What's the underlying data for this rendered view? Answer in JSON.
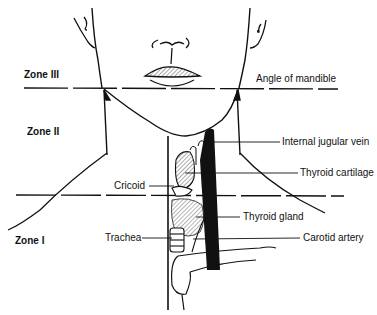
{
  "zones": [
    {
      "id": "zone-3",
      "label": "Zone III"
    },
    {
      "id": "zone-2",
      "label": "Zone II"
    },
    {
      "id": "zone-1",
      "label": "Zone I"
    }
  ],
  "labels": {
    "angle_of_mandible": "Angle of mandible",
    "internal_jugular_vein": "Internal jugular vein",
    "thyroid_cartilage": "Thyroid cartilage",
    "cricoid": "Cricoid",
    "thyroid_gland": "Thyroid gland",
    "trachea": "Trachea",
    "carotid_artery": "Carotid artery"
  },
  "colors": {
    "line": "#111111",
    "background": "#ffffff",
    "hatch": "#555555"
  }
}
